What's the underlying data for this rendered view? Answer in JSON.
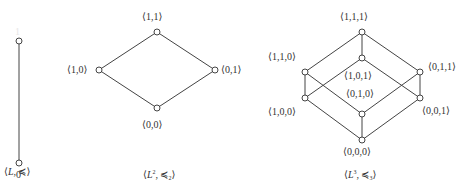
{
  "figure": {
    "diagrams": [
      {
        "id": "chain",
        "caption": {
          "open": "⟨",
          "set": "L",
          "sep": ", ",
          "rel": "≼",
          "sub": "",
          "sup": "",
          "close": "⟩"
        },
        "nodes": [
          {
            "id": "1",
            "label": "1",
            "x": 19,
            "y": 41
          },
          {
            "id": "0",
            "label": "0",
            "x": 19,
            "y": 163
          }
        ],
        "edges": [
          [
            "1",
            "0"
          ]
        ]
      },
      {
        "id": "square",
        "caption": {
          "open": "⟨",
          "set": "L",
          "sep": ", ",
          "rel": "≼",
          "sub": "2",
          "sup": "2",
          "close": "⟩"
        },
        "nodes": [
          {
            "id": "11",
            "label": "⟨1,1⟩",
            "x": 157,
            "y": 32
          },
          {
            "id": "10",
            "label": "⟨1,0⟩",
            "x": 99,
            "y": 70
          },
          {
            "id": "01",
            "label": "⟨0,1⟩",
            "x": 215,
            "y": 70
          },
          {
            "id": "00",
            "label": "⟨0,0⟩",
            "x": 157,
            "y": 108
          }
        ],
        "edges": [
          [
            "11",
            "10"
          ],
          [
            "11",
            "01"
          ],
          [
            "10",
            "00"
          ],
          [
            "01",
            "00"
          ]
        ]
      },
      {
        "id": "cube",
        "caption": {
          "open": "⟨",
          "set": "L",
          "sep": ", ",
          "rel": "≼",
          "sub": "3",
          "sup": "3",
          "close": "⟩"
        },
        "nodes": [
          {
            "id": "111",
            "label": "⟨1,1,1⟩",
            "x": 362,
            "y": 32
          },
          {
            "id": "101",
            "label": "⟨1,0,1⟩",
            "x": 362,
            "y": 58
          },
          {
            "id": "110",
            "label": "⟨1,1,0⟩",
            "x": 305,
            "y": 72
          },
          {
            "id": "011",
            "label": "⟨0,1,1⟩",
            "x": 420,
            "y": 72
          },
          {
            "id": "100",
            "label": "⟨1,0,0⟩",
            "x": 305,
            "y": 98
          },
          {
            "id": "001",
            "label": "⟨0,0,1⟩",
            "x": 420,
            "y": 98
          },
          {
            "id": "010",
            "label": "⟨0,1,0⟩",
            "x": 362,
            "y": 114
          },
          {
            "id": "000",
            "label": "⟨0,0,0⟩",
            "x": 362,
            "y": 140
          }
        ],
        "edges": [
          [
            "111",
            "110"
          ],
          [
            "111",
            "011"
          ],
          [
            "111",
            "101"
          ],
          [
            "110",
            "100"
          ],
          [
            "110",
            "010"
          ],
          [
            "011",
            "001"
          ],
          [
            "011",
            "010"
          ],
          [
            "101",
            "100"
          ],
          [
            "101",
            "001"
          ],
          [
            "100",
            "000"
          ],
          [
            "001",
            "000"
          ],
          [
            "010",
            "000"
          ]
        ]
      }
    ]
  }
}
